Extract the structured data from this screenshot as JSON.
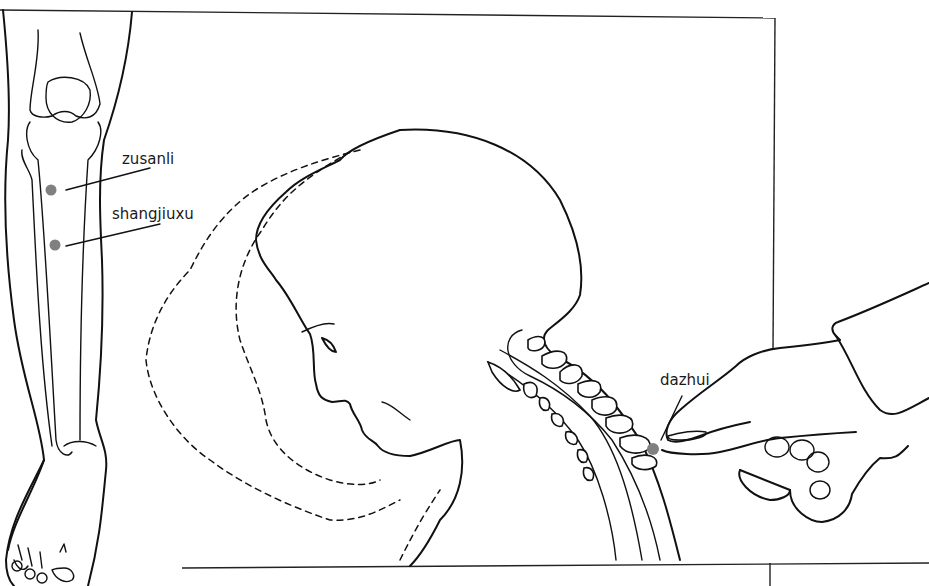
{
  "figure": {
    "type": "anatomical-illustration"
  },
  "labels": {
    "zusanli": "zusanli",
    "shangjiuxu": "shangjiuxu",
    "dazhui": "dazhui"
  },
  "points": [
    {
      "name": "zusanli",
      "x": 51,
      "y": 190,
      "label_x": 122,
      "label_y": 160
    },
    {
      "name": "shangjiuxu",
      "x": 55,
      "y": 245,
      "label_x": 110,
      "label_y": 212
    },
    {
      "name": "dazhui",
      "x": 653,
      "y": 449,
      "label_x": 660,
      "label_y": 372
    }
  ],
  "colors": {
    "line": "#111111",
    "point": "#808080",
    "background": "#ffffff"
  }
}
